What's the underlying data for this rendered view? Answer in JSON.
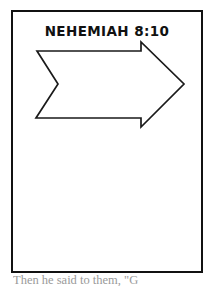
{
  "page": {
    "background_color": "#ffffff",
    "ink_color": "#111111"
  },
  "worksheet": {
    "frame": {
      "border_color": "#111111",
      "fill_color": "#ffffff"
    },
    "title": "NEHEMIAH 8:10",
    "illustration": {
      "name": "right-pointing-arrow",
      "description": "Hand drawn outline of a banner style arrow pointing to the right with a notched tail",
      "stroke_color": "#1a1a1a",
      "fill_color": "#ffffff",
      "direction": "right",
      "points": "24,39 128,39 128,30 171,72 128,115 128,106 23,106 45,72"
    }
  },
  "caption": {
    "text": "Then he said to them, \"G"
  }
}
